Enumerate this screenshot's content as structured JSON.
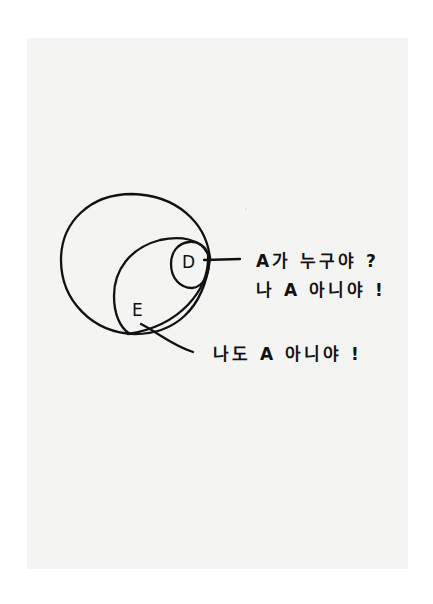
{
  "diagram": {
    "type": "nested-set-venn",
    "style": "hand-drawn ink on paper",
    "paper_color": "#f4f4f3",
    "ink_color": "#111111",
    "sets": [
      {
        "id": "outer",
        "label": ""
      },
      {
        "id": "E",
        "label": "E"
      },
      {
        "id": "D",
        "label": "D"
      }
    ],
    "callouts": {
      "D": {
        "line1": "A가 누구야 ?",
        "line2": "나 A 아니야 !"
      },
      "E": {
        "line1": "나도 A 아니야 !"
      }
    }
  }
}
